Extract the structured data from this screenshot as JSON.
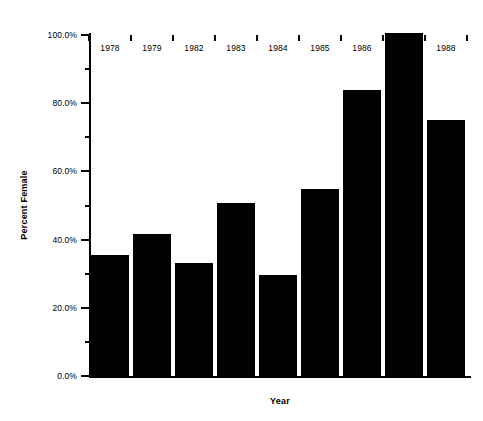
{
  "chart_data": {
    "type": "bar",
    "title": "",
    "subtitle": "",
    "xlabel": "Year",
    "ylabel": "Percent Female",
    "categories": [
      "1978",
      "1979",
      "1982",
      "1983",
      "1984",
      "1985",
      "1986",
      "1987",
      "1988"
    ],
    "values": [
      35.5,
      41.6,
      33.1,
      50.7,
      29.6,
      54.8,
      83.9,
      100.6,
      75.1
    ],
    "value_labels": [
      "35.5%",
      "41.6%",
      "33.1%",
      "50.7%",
      "29.6%",
      "54.8%",
      "83.9%",
      "100.6%",
      "75.1%"
    ],
    "ylim": [
      0,
      100
    ],
    "xlim_note": "categorical",
    "y_major_ticks": [
      0,
      20,
      40,
      60,
      80,
      100
    ],
    "y_major_tick_labels": [
      "0.0%",
      "20.0%",
      "40.0%",
      "60.0%",
      "80.0%",
      "100.0%"
    ],
    "y_minor_ticks": [
      10,
      30,
      50,
      70,
      90
    ],
    "grid": false,
    "legend": null,
    "legend_position": "none",
    "bar_color": "#000000",
    "axis_color": "#000000",
    "background_color": "#ffffff",
    "annotations": []
  }
}
